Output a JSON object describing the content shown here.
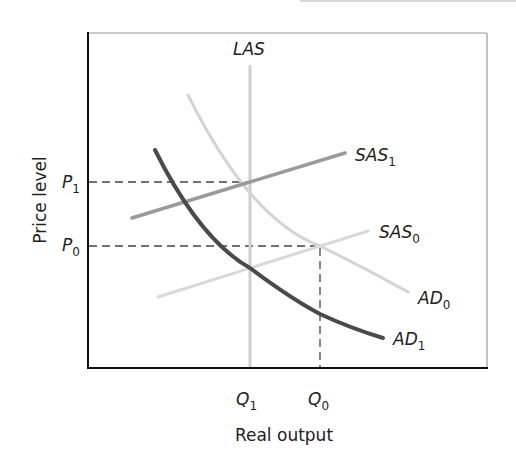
{
  "diagram": {
    "title": "",
    "x_axis_label": "Real output",
    "y_axis_label": "Price level",
    "curves": [
      {
        "id": "LAS",
        "label": "LAS",
        "subscript": "",
        "kind": "vertical",
        "color": "#cfcfcf"
      },
      {
        "id": "SAS1",
        "label": "SAS",
        "subscript": "1",
        "kind": "upward-sloping",
        "color": "#9a9a9a"
      },
      {
        "id": "SAS0",
        "label": "SAS",
        "subscript": "0",
        "kind": "upward-sloping",
        "color": "#d9d9d9"
      },
      {
        "id": "AD0",
        "label": "AD",
        "subscript": "0",
        "kind": "downward-sloping",
        "color": "#d4d4d4"
      },
      {
        "id": "AD1",
        "label": "AD",
        "subscript": "1",
        "kind": "downward-sloping",
        "color": "#4a4a4a"
      }
    ],
    "y_ticks": [
      {
        "label": "P",
        "subscript": "1"
      },
      {
        "label": "P",
        "subscript": "0"
      }
    ],
    "x_ticks": [
      {
        "label": "Q",
        "subscript": "1"
      },
      {
        "label": "Q",
        "subscript": "0"
      }
    ],
    "equilibria": [
      {
        "name": "initial",
        "price": "P0",
        "output": "Q0",
        "curves": [
          "AD0",
          "SAS0"
        ]
      },
      {
        "name": "new",
        "price": "P1",
        "output": "Q1",
        "curves": [
          "LAS",
          "SAS1"
        ]
      }
    ]
  }
}
